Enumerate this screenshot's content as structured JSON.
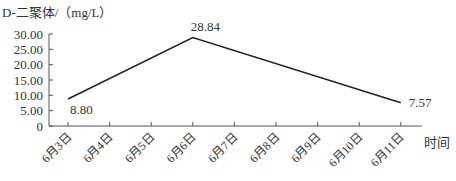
{
  "chart_data": {
    "type": "line",
    "title": "",
    "ylabel": "D-二聚体/（mg/L）",
    "xlabel": "时间",
    "categories": [
      "6月3日",
      "6月4日",
      "6月5日",
      "6月6日",
      "6月7日",
      "6月8日",
      "6月9日",
      "6月10日",
      "6月11日"
    ],
    "series": [
      {
        "name": "D-二聚体",
        "points": [
          {
            "x": "6月3日",
            "y": 8.8
          },
          {
            "x": "6月6日",
            "y": 28.84
          },
          {
            "x": "6月11日",
            "y": 7.57
          }
        ]
      }
    ],
    "data_labels": [
      "8.80",
      "28.84",
      "7.57"
    ],
    "yticks": [
      "0",
      "5.00",
      "10.00",
      "15.00",
      "20.00",
      "25.00",
      "30.00"
    ],
    "ylim": [
      0,
      30
    ],
    "grid": false,
    "legend": "none",
    "line_color": "#222222"
  }
}
